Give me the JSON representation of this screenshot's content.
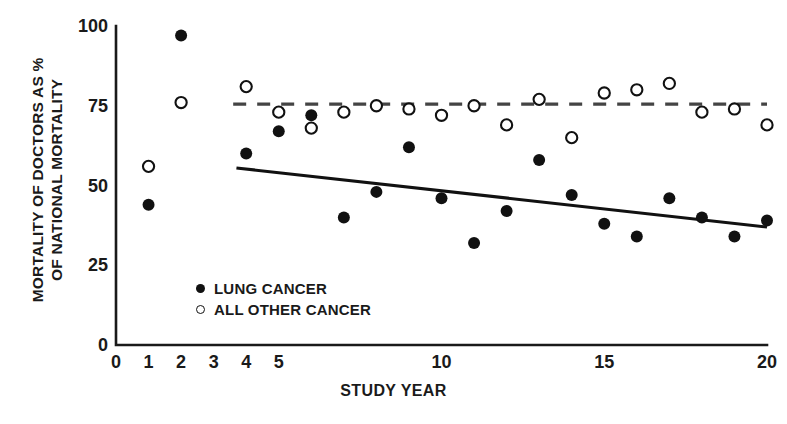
{
  "chart_data": {
    "type": "scatter",
    "title": "",
    "xlabel": "STUDY YEAR",
    "ylabel_line1": "MORTALITY OF DOCTORS AS %",
    "ylabel_line2": "OF NATIONAL MORTALITY",
    "xlim": [
      0,
      20
    ],
    "ylim": [
      0,
      100
    ],
    "xticks": [
      0,
      1,
      2,
      3,
      4,
      5,
      10,
      15,
      20
    ],
    "xtick_labels": [
      "0",
      "1",
      "2",
      "3",
      "4",
      "5",
      "10",
      "15",
      "20"
    ],
    "yticks": [
      0,
      25,
      50,
      75,
      100
    ],
    "ytick_labels": [
      "0",
      "25",
      "50",
      "75",
      "100"
    ],
    "grid": false,
    "legend_position": "lower-left-inside",
    "series": [
      {
        "name": "LUNG CANCER",
        "marker": "filled-circle",
        "color": "#111111",
        "x": [
          1,
          2,
          4,
          5,
          6,
          7,
          8,
          9,
          10,
          11,
          12,
          13,
          14,
          15,
          16,
          17,
          18,
          19,
          20
        ],
        "values": [
          44,
          97,
          60,
          67,
          72,
          40,
          48,
          62,
          46,
          32,
          42,
          58,
          47,
          38,
          34,
          46,
          40,
          34,
          39
        ]
      },
      {
        "name": "ALL OTHER CANCER",
        "marker": "open-circle",
        "color": "#111111",
        "x": [
          1,
          2,
          4,
          5,
          6,
          7,
          8,
          9,
          10,
          11,
          12,
          13,
          14,
          15,
          16,
          17,
          18,
          19,
          20
        ],
        "values": [
          56,
          76,
          81,
          73,
          68,
          73,
          75,
          74,
          72,
          75,
          69,
          77,
          65,
          79,
          80,
          82,
          73,
          74,
          69
        ]
      }
    ],
    "trend_lines": [
      {
        "name": "lung-cancer-trend",
        "style": "solid",
        "color": "#111111",
        "x": [
          3.7,
          20.0
        ],
        "y": [
          55.5,
          37.0
        ]
      },
      {
        "name": "all-other-cancer-trend",
        "style": "dashed",
        "color": "#444444",
        "x": [
          3.6,
          20.0
        ],
        "y": [
          75.5,
          75.5
        ]
      }
    ],
    "legend_entries": [
      {
        "label": "LUNG CANCER",
        "marker": "filled-circle"
      },
      {
        "label": "ALL OTHER CANCER",
        "marker": "open-circle"
      }
    ]
  },
  "axis": {
    "x_title": "STUDY YEAR",
    "y_title_line1": "MORTALITY OF DOCTORS AS %",
    "y_title_line2": "OF NATIONAL MORTALITY"
  },
  "legend": {
    "lung_label": "LUNG CANCER",
    "other_label": "ALL OTHER CANCER"
  },
  "colors": {
    "ink": "#111111",
    "axis": "#1a1a1a",
    "dash": "#444444",
    "background": "#ffffff"
  }
}
